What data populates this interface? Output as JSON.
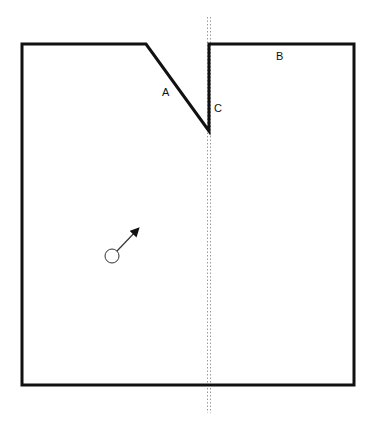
{
  "diagram": {
    "labels": {
      "a": "A",
      "b": "B",
      "c": "C"
    },
    "shape": {
      "stroke_color": "#111111",
      "stroke_width": 3,
      "outline_points": [
        [
          22,
          44
        ],
        [
          146,
          44
        ],
        [
          209,
          131
        ],
        [
          209,
          44
        ],
        [
          354,
          44
        ],
        [
          354,
          385
        ],
        [
          22,
          385
        ]
      ]
    },
    "symmetry_axis": {
      "x": 209,
      "y_top": 17,
      "y_bottom": 413,
      "style": "dotted",
      "color": "#9a9a9a"
    },
    "ball": {
      "cx": 112,
      "cy": 256,
      "r": 7,
      "arrow_to": [
        139,
        228
      ]
    }
  }
}
